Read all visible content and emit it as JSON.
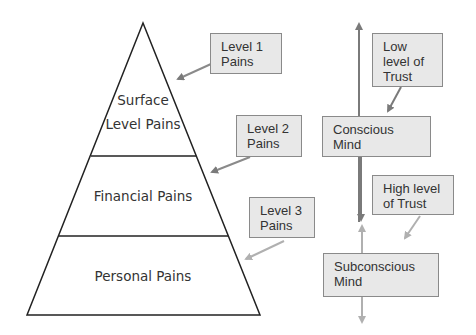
{
  "pyramid": {
    "levels": [
      {
        "line1": "Surface",
        "line2": "Level Pains"
      },
      {
        "line1": "Financial Pains"
      },
      {
        "line1": "Personal Pains"
      }
    ]
  },
  "callouts": [
    {
      "line1": "Level 1",
      "line2": "Pains"
    },
    {
      "line1": "Level 2",
      "line2": "Pains"
    },
    {
      "line1": "Level 3",
      "line2": "Pains"
    }
  ],
  "mind": {
    "conscious": {
      "line1": "Conscious",
      "line2": "Mind"
    },
    "subconscious": {
      "line1": "Subconscious",
      "line2": "Mind"
    },
    "low_trust": {
      "line1": "Low",
      "line2": "level of",
      "line3": "Trust"
    },
    "high_trust": {
      "line1": "High level",
      "line2": "of Trust"
    }
  },
  "colors": {
    "line": "#222222",
    "arrow_dark": "#7a7a7a",
    "arrow_light": "#b0b0b0",
    "box_fill": "#e8e8e8",
    "box_border": "#8a8a8a"
  }
}
